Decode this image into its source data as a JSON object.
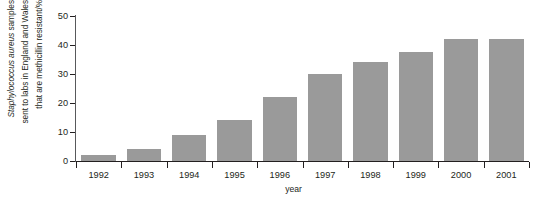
{
  "chart_data": {
    "type": "bar",
    "title": "",
    "subtitle": "",
    "xlabel": "year",
    "ylabel_lines": [
      "Staphylococcus aureus samples",
      "sent to labs in England and Wales",
      "that are methicillin resistant/%"
    ],
    "ylabel_italic_part": "Staphylococcus aureus",
    "ylabel_plain_part": " samples",
    "categories": [
      "1992",
      "1993",
      "1994",
      "1995",
      "1996",
      "1997",
      "1998",
      "1999",
      "2000",
      "2001"
    ],
    "values": [
      2,
      4,
      9,
      14,
      22,
      30,
      34,
      37.5,
      42,
      42
    ],
    "ylim": [
      0,
      50
    ],
    "yticks": [
      0,
      10,
      20,
      30,
      40,
      50
    ],
    "ytick_labels": [
      "0",
      "10",
      "20",
      "30",
      "40",
      "50"
    ],
    "grid": false,
    "legend": false,
    "legend_position": "none",
    "bar_color": "#9a9a9a",
    "axis_color": "#231f20",
    "text_color": "#231f20",
    "background": "#ffffff"
  }
}
